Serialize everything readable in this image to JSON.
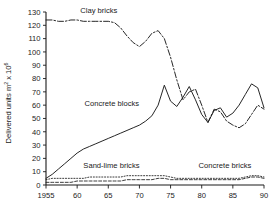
{
  "chart_data": {
    "type": "line",
    "title": "",
    "xlabel": "",
    "ylabel": "Delivered units m² x 10⁶",
    "ylabel_base": "Delivered units m",
    "ylabel_sup1": "2",
    "ylabel_mid": " x 10",
    "ylabel_sup2": "6",
    "xlim": [
      1955,
      1990
    ],
    "ylim": [
      0,
      130
    ],
    "yticks": [
      0,
      10,
      20,
      30,
      40,
      50,
      60,
      70,
      80,
      90,
      100,
      110,
      120,
      130
    ],
    "ytick_labels": [
      "0",
      "10",
      "20",
      "30",
      "40",
      "50",
      "60",
      "70",
      "80",
      "90",
      "100",
      "110",
      "120",
      "130"
    ],
    "xticks": [
      1955,
      1960,
      1965,
      1970,
      1975,
      1980,
      1985,
      1990
    ],
    "xtick_labels": [
      "1955",
      "60",
      "65",
      "70",
      "75",
      "80",
      "85",
      "90"
    ],
    "grid": false,
    "legend_position": "inline-annotations",
    "x": [
      1955,
      1956,
      1957,
      1958,
      1959,
      1960,
      1961,
      1962,
      1963,
      1964,
      1965,
      1966,
      1967,
      1968,
      1969,
      1970,
      1971,
      1972,
      1973,
      1974,
      1975,
      1976,
      1977,
      1978,
      1979,
      1980,
      1981,
      1982,
      1983,
      1984,
      1985,
      1986,
      1987,
      1988,
      1989,
      1990
    ],
    "series": [
      {
        "name": "Clay bricks",
        "style": "dash-dot",
        "annotation": "Clay bricks",
        "values": [
          124,
          124,
          123,
          123,
          124,
          124,
          123,
          123,
          123,
          123,
          123,
          122,
          118,
          112,
          107,
          104,
          108,
          114,
          116,
          110,
          96,
          79,
          64,
          70,
          72,
          60,
          47,
          57,
          55,
          48,
          45,
          43,
          46,
          53,
          60,
          57
        ]
      },
      {
        "name": "Concrete blocks",
        "style": "solid",
        "annotation": "Concrete blocks",
        "values": [
          5,
          8,
          12,
          16,
          20,
          24,
          27,
          29,
          31,
          33,
          35,
          37,
          39,
          41,
          43,
          45,
          48,
          52,
          60,
          75,
          63,
          59,
          66,
          74,
          64,
          53,
          47,
          56,
          58,
          51,
          54,
          60,
          68,
          76,
          73,
          58
        ]
      },
      {
        "name": "Sand-lime bricks",
        "style": "dotted",
        "annotation": "Sand-lime bricks",
        "values": [
          4,
          5,
          5,
          5,
          5,
          5,
          5,
          6,
          6,
          6,
          6,
          6,
          6,
          7,
          7,
          7,
          7,
          7,
          7,
          7,
          6,
          5,
          5,
          5,
          5,
          5,
          5,
          5,
          5,
          5,
          5,
          5,
          6,
          7,
          7,
          6
        ]
      },
      {
        "name": "Concrete bricks",
        "style": "dashed",
        "annotation": "Concrete bricks",
        "values": [
          2,
          2,
          2,
          2,
          2,
          3,
          3,
          3,
          3,
          3,
          3,
          3,
          3,
          4,
          4,
          4,
          4,
          4,
          5,
          5,
          4,
          4,
          4,
          4,
          4,
          4,
          4,
          4,
          4,
          4,
          4,
          4,
          5,
          6,
          6,
          5
        ]
      }
    ],
    "annotations": [
      {
        "text": "Clay bricks",
        "x": 1960.5,
        "y": 129
      },
      {
        "text": "Concrete blocks",
        "x": 1961.2,
        "y": 59
      },
      {
        "text": "Sand-lime bricks",
        "x": 1961.0,
        "y": 13
      },
      {
        "text": "Concrete bricks",
        "x": 1979.5,
        "y": 13
      }
    ],
    "colors": {
      "ink": "#1a1a1a",
      "background": "#ffffff"
    }
  }
}
